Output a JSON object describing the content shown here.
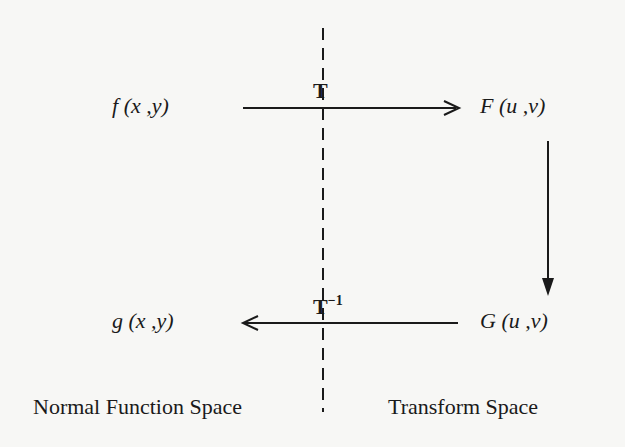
{
  "nodes": {
    "f": {
      "func": "f",
      "args": "(x ,y)"
    },
    "F": {
      "func": "F",
      "args": "(u ,v)"
    },
    "g": {
      "func": "g",
      "args": "(x ,y)"
    },
    "G": {
      "func": "G",
      "args": "(u ,v)"
    }
  },
  "edges": {
    "forward": {
      "label": "T",
      "from": "f(x,y)",
      "to": "F(u,v)"
    },
    "inverse": {
      "label": "T",
      "superscript": "−1",
      "from": "G(u,v)",
      "to": "g(x,y)"
    },
    "modify": {
      "from": "F(u,v)",
      "to": "G(u,v)"
    }
  },
  "regions": {
    "left": "Normal Function Space",
    "right": "Transform Space"
  },
  "colors": {
    "background": "#f7f7f5",
    "ink": "#1a1a1a"
  }
}
